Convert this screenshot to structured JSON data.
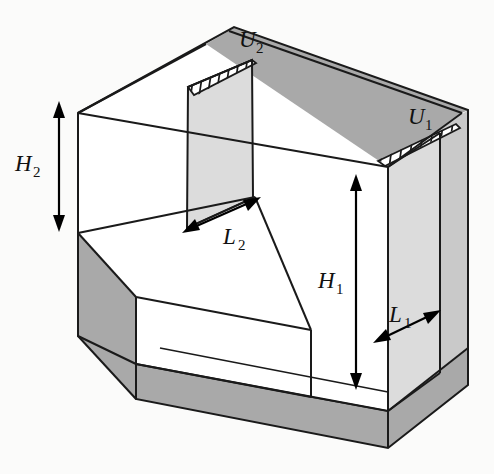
{
  "figure": {
    "type": "engineering-isometric-diagram",
    "background_color": "#fbfbfa",
    "line_color": "#1a1a1a"
  },
  "colors": {
    "outline": "#1a1a1a",
    "wall_dark": "#a9a9a9",
    "wall_mid": "#c9c9c9",
    "plate_light": "#dcdcdc",
    "face_white": "#ffffff",
    "background": "#fbfbfa",
    "arrow": "#000000"
  },
  "labels": [
    {
      "id": "U2",
      "base": "U",
      "subscript": "2",
      "x": 245,
      "y": 42,
      "meaning": "inlet-velocity-upper-step"
    },
    {
      "id": "U1",
      "base": "U",
      "subscript": "1",
      "x": 414,
      "y": 119,
      "meaning": "inlet-velocity-lower-step"
    },
    {
      "id": "H2",
      "base": "H",
      "subscript": "2",
      "x": 22,
      "y": 166,
      "meaning": "upper-step-height"
    },
    {
      "id": "H1",
      "base": "H",
      "subscript": "1",
      "x": 324,
      "y": 283,
      "meaning": "lower-step-height"
    },
    {
      "id": "L2",
      "base": "L",
      "subscript": "2",
      "x": 206,
      "y": 241,
      "meaning": "upper-step-length"
    },
    {
      "id": "L1",
      "base": "L",
      "subscript": "1",
      "x": 392,
      "y": 318,
      "meaning": "lower-step-length"
    }
  ],
  "dimensions": [
    {
      "name": "H2",
      "orientation": "vertical",
      "x1": 59,
      "y1": 105,
      "x2": 59,
      "y2": 228,
      "double_headed": true
    },
    {
      "name": "H1",
      "orientation": "vertical",
      "x1": 356,
      "y1": 178,
      "x2": 356,
      "y2": 386,
      "double_headed": true
    },
    {
      "name": "L2",
      "orientation": "diagonal",
      "x1": 186,
      "y1": 231,
      "x2": 256,
      "y2": 199,
      "double_headed": true
    },
    {
      "name": "L1",
      "orientation": "diagonal",
      "x1": 377,
      "y1": 341,
      "x2": 436,
      "y2": 312,
      "double_headed": true
    }
  ],
  "hatched_regions": [
    {
      "name": "hatch-U2",
      "location": "top-left-inlet",
      "line_count": 7
    },
    {
      "name": "hatch-U1",
      "location": "right-inlet",
      "line_count": 8
    }
  ],
  "faces": [
    {
      "name": "top-rim-back",
      "shade": "wall_dark"
    },
    {
      "name": "left-outer-wall",
      "shade": "wall_dark"
    },
    {
      "name": "bottom-front-rim",
      "shade": "wall_dark"
    },
    {
      "name": "right-outer-wall",
      "shade": "wall_mid"
    },
    {
      "name": "right-inner-wall",
      "shade": "plate_light"
    },
    {
      "name": "center-baffle-plate",
      "shade": "plate_light"
    },
    {
      "name": "interior-back-wall",
      "shade": "face_white"
    },
    {
      "name": "step-top-surface",
      "shade": "face_white"
    },
    {
      "name": "step-riser-face",
      "shade": "face_white"
    },
    {
      "name": "cavity-floor",
      "shade": "face_white"
    }
  ]
}
